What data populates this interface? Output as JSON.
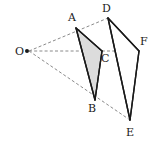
{
  "figure": {
    "background_color": "#ffffff",
    "stroke_color": "#1a1a1a",
    "ray_color": "#8a8a8a",
    "shade_color": "#dcdcdc",
    "points": {
      "O": {
        "label": "O",
        "x": 27,
        "y": 51,
        "label_x": 15,
        "label_y": 55
      },
      "A": {
        "label": "A",
        "x": 76,
        "y": 28,
        "label_x": 68,
        "label_y": 21
      },
      "B": {
        "label": "B",
        "x": 95,
        "y": 100,
        "label_x": 88,
        "label_y": 112
      },
      "C": {
        "label": "C",
        "x": 102,
        "y": 51,
        "label_x": 101,
        "label_y": 62
      },
      "D": {
        "label": "D",
        "x": 108,
        "y": 18,
        "label_x": 102,
        "label_y": 12
      },
      "E": {
        "label": "E",
        "x": 130,
        "y": 120,
        "label_x": 126,
        "label_y": 136
      },
      "F": {
        "label": "F",
        "x": 139,
        "y": 51,
        "label_x": 140,
        "label_y": 45
      }
    },
    "shapes": {
      "inner_triangle": {
        "name": "triangle-ABC",
        "vertices": "76,28 102,51 95,100",
        "filled": "shaded"
      },
      "outer_triangle": {
        "name": "triangle-DEF",
        "vertices": "108,18 139,51 130,120",
        "filled": "open"
      }
    },
    "rays": [
      {
        "name": "ray-O-A-D",
        "d": "M 29 51 L 108 18"
      },
      {
        "name": "ray-O-C-F",
        "d": "M 29 51 L 139 51"
      },
      {
        "name": "ray-O-B-E",
        "d": "M 29 51 L 130 120"
      }
    ],
    "edges": [
      {
        "name": "edge-A-C",
        "d": "M 76 28 L 102 51"
      },
      {
        "name": "edge-A-B",
        "d": "M 76 28 L 95 100"
      },
      {
        "name": "edge-C-B",
        "d": "M 102 51 L 95 100"
      },
      {
        "name": "edge-D-F",
        "d": "M 108 18 L 139 51"
      },
      {
        "name": "edge-D-E",
        "d": "M 108 18 L 130 120"
      },
      {
        "name": "edge-F-E",
        "d": "M 139 51 L 130 120"
      }
    ]
  }
}
